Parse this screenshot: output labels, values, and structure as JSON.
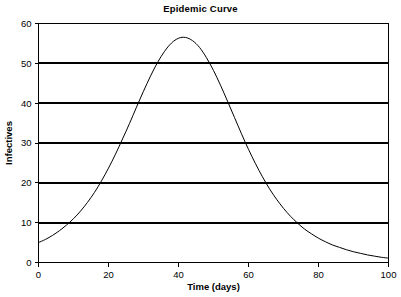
{
  "chart_data": {
    "type": "line",
    "title": "Epidemic Curve",
    "xlabel": "Time (days)",
    "ylabel": "Infectives",
    "xlim": [
      0,
      100
    ],
    "ylim": [
      0,
      60
    ],
    "xticks": [
      "0",
      "20",
      "40",
      "60",
      "80",
      "100"
    ],
    "yticks": [
      "0",
      "10",
      "20",
      "30",
      "40",
      "50",
      "60"
    ],
    "xtick_values": [
      0,
      20,
      40,
      60,
      80,
      100
    ],
    "ytick_values": [
      0,
      10,
      20,
      30,
      40,
      50,
      60
    ],
    "grid": "horizontal",
    "legend": null,
    "series": [
      {
        "name": "Infectives",
        "color": "#000000",
        "x": [
          0,
          2,
          4,
          6,
          8,
          10,
          12,
          14,
          16,
          18,
          20,
          22,
          24,
          26,
          28,
          30,
          32,
          34,
          36,
          38,
          40,
          42,
          44,
          46,
          48,
          50,
          52,
          54,
          56,
          58,
          60,
          62,
          64,
          66,
          68,
          70,
          72,
          74,
          76,
          78,
          80,
          82,
          84,
          86,
          88,
          90,
          92,
          94,
          96,
          98,
          100
        ],
        "y": [
          5.0,
          5.8,
          6.8,
          8.0,
          9.4,
          11.0,
          12.9,
          15.1,
          17.6,
          20.5,
          23.7,
          27.2,
          31.0,
          34.9,
          39.0,
          43.0,
          46.8,
          50.2,
          53.0,
          55.1,
          56.3,
          56.5,
          55.7,
          54.0,
          51.4,
          48.2,
          44.5,
          40.5,
          36.4,
          32.3,
          28.4,
          24.8,
          21.5,
          18.5,
          15.9,
          13.6,
          11.6,
          9.9,
          8.4,
          7.2,
          6.1,
          5.2,
          4.4,
          3.8,
          3.2,
          2.7,
          2.3,
          1.9,
          1.6,
          1.3,
          1.1
        ]
      }
    ]
  }
}
